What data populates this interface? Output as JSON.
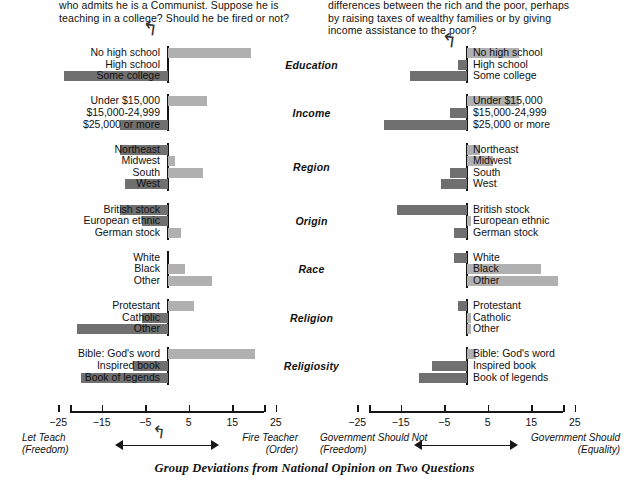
{
  "caption": "Group Deviations from National Opinion on Two Questions",
  "left": {
    "question": "who admits he is a Communist. Suppose he is teaching in a college? Should he be fired or not?",
    "anchor_left": "Let Teach",
    "anchor_left_sub": "(Freedom)",
    "anchor_right": "Fire Teacher",
    "anchor_right_sub": "(Order)",
    "curly": "↱"
  },
  "right": {
    "question": "differences between the rich and the poor, perhaps by raising taxes of wealthy families or by giving income assistance to the poor?",
    "anchor_left": "Government Should Not",
    "anchor_left_sub": "(Freedom)",
    "anchor_right": "Government Should",
    "anchor_right_sub": "(Equality)",
    "curly": "↱"
  },
  "axis": {
    "ticks": [
      -25,
      -15,
      -5,
      5,
      15,
      25
    ],
    "tick_labels": [
      "−25",
      "−15",
      "−5",
      "5",
      "15",
      "25"
    ],
    "min": -30,
    "max": 30
  },
  "colors": {
    "positive_bar": "#b0b0b0",
    "negative_bar": "#707070",
    "axis": "#161616",
    "text": "#111111",
    "background": "#ffffff"
  },
  "groups": [
    "Education",
    "Income",
    "Region",
    "Origin",
    "Race",
    "Religion",
    "Religiosity"
  ],
  "chart_data": {
    "type": "bar",
    "title": "Group Deviations from National Opinion on Two Questions",
    "orientation": "horizontal",
    "xlabel": "",
    "ylabel": "",
    "xlim": [
      -30,
      30
    ],
    "grid": false,
    "legend": "none",
    "panels": [
      {
        "name": "left",
        "title": "who admits he is a Communist. Suppose he is teaching in a college? Should he be fired or not?",
        "axis_left_label": "Let Teach (Freedom)",
        "axis_right_label": "Fire Teacher (Order)",
        "groups": [
          {
            "group": "Education",
            "categories": [
              "No high school",
              "High school",
              "Some college"
            ],
            "values": [
              19,
              0,
              -24
            ]
          },
          {
            "group": "Income",
            "categories": [
              "Under $15,000",
              "$15,000-24,999",
              "$25,000 or more"
            ],
            "values": [
              9,
              0,
              -11
            ]
          },
          {
            "group": "Region",
            "categories": [
              "Northeast",
              "Midwest",
              "South",
              "West"
            ],
            "values": [
              -11,
              1.5,
              8,
              -10
            ]
          },
          {
            "group": "Origin",
            "categories": [
              "British stock",
              "European ethnic",
              "German stock"
            ],
            "values": [
              -11,
              -6,
              3
            ]
          },
          {
            "group": "Race",
            "categories": [
              "White",
              "Black",
              "Other"
            ],
            "values": [
              0,
              4,
              10
            ]
          },
          {
            "group": "Religion",
            "categories": [
              "Protestant",
              "Catholic",
              "Other"
            ],
            "values": [
              6,
              -6,
              -21
            ]
          },
          {
            "group": "Religiosity",
            "categories": [
              "Bible: God's word",
              "Inspired book",
              "Book of legends"
            ],
            "values": [
              20,
              -8,
              -20
            ]
          }
        ]
      },
      {
        "name": "right",
        "title": "differences between the rich and the poor, perhaps by raising taxes of wealthy families or by giving income assistance to the poor?",
        "axis_left_label": "Government Should Not (Freedom)",
        "axis_right_label": "Government Should (Equality)",
        "groups": [
          {
            "group": "Education",
            "categories": [
              "No high school",
              "High school",
              "Some college"
            ],
            "values": [
              12,
              -2,
              -13
            ]
          },
          {
            "group": "Income",
            "categories": [
              "Under $15,000",
              "$15,000-24,999",
              "$25,000 or more"
            ],
            "values": [
              12,
              -4,
              -19
            ]
          },
          {
            "group": "Region",
            "categories": [
              "Northeast",
              "Midwest",
              "South",
              "West"
            ],
            "values": [
              3,
              6,
              -4,
              -6
            ]
          },
          {
            "group": "Origin",
            "categories": [
              "British stock",
              "European ethnic",
              "German stock"
            ],
            "values": [
              -16,
              1,
              -3
            ]
          },
          {
            "group": "Race",
            "categories": [
              "White",
              "Black",
              "Other"
            ],
            "values": [
              -3,
              17,
              21
            ]
          },
          {
            "group": "Religion",
            "categories": [
              "Protestant",
              "Catholic",
              "Other"
            ],
            "values": [
              -2,
              1,
              1
            ]
          },
          {
            "group": "Religiosity",
            "categories": [
              "Bible: God's word",
              "Inspired book",
              "Book of legends"
            ],
            "values": [
              2,
              -8,
              -11
            ]
          }
        ]
      }
    ]
  }
}
